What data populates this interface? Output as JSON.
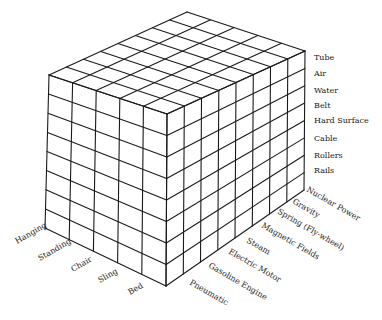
{
  "diagram": {
    "type": "3d-morphological-matrix-cube",
    "front_face_axis": {
      "name": "posture",
      "labels": [
        "Hanging",
        "Standing",
        "Chair",
        "Sling",
        "Bed"
      ]
    },
    "right_face_axis": {
      "name": "power-source",
      "labels": [
        "Pneumatic",
        "Gasoline Engine",
        "Electric Motor",
        "Steam",
        "Magnetic Fields",
        "Spring (Fly-wheel)",
        "Gravity",
        "Nuclear Power"
      ]
    },
    "vertical_axis": {
      "name": "medium",
      "labels": [
        "Tube",
        "Air",
        "Water",
        "Belt",
        "Hard Surface",
        "Cable",
        "Rollers",
        "Rails"
      ]
    },
    "colors": {
      "line": "#1a1a1a",
      "text": "#1a1a1a",
      "background": "#ffffff"
    }
  }
}
